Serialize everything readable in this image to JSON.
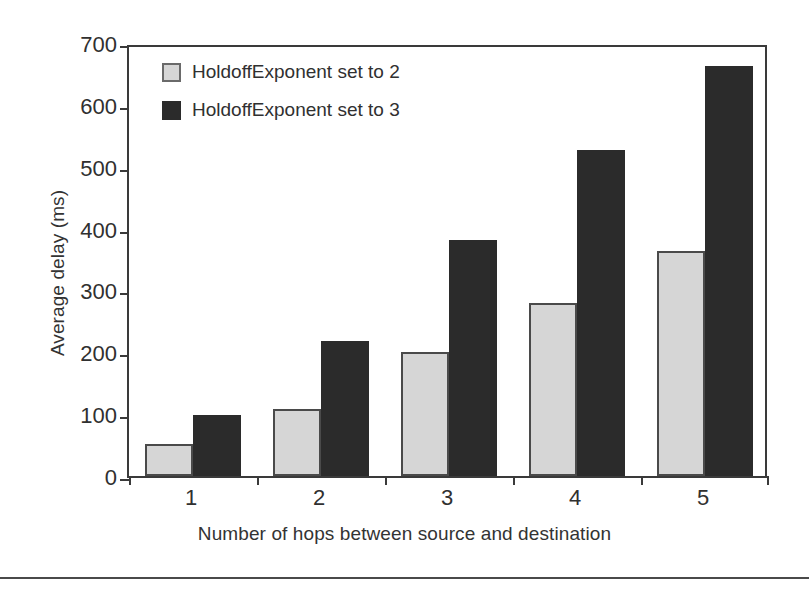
{
  "chart_data": {
    "type": "bar",
    "title": "",
    "xlabel": "Number of hops between source and destination",
    "ylabel": "Average delay (ms)",
    "categories": [
      "1",
      "2",
      "3",
      "4",
      "5"
    ],
    "series": [
      {
        "name": "HoldoffExponent set to 2",
        "color": "#d6d6d6",
        "values": [
          52,
          108,
          201,
          280,
          363
        ]
      },
      {
        "name": "HoldoffExponent set to 3",
        "color": "#2b2b2b",
        "values": [
          99,
          219,
          381,
          527,
          663
        ]
      }
    ],
    "ylim": [
      0,
      700
    ],
    "yticks": [
      0,
      100,
      200,
      300,
      400,
      500,
      600,
      700
    ],
    "ytick_labels": [
      "0",
      "100",
      "200",
      "300",
      "400",
      "500",
      "600",
      "700"
    ],
    "grid": false,
    "legend_position": "top-left"
  },
  "legend": {
    "items": [
      {
        "label": "HoldoffExponent set to 2",
        "swatch": "light-gray-square"
      },
      {
        "label": "HoldoffExponent set to 3",
        "swatch": "black-square"
      }
    ]
  }
}
